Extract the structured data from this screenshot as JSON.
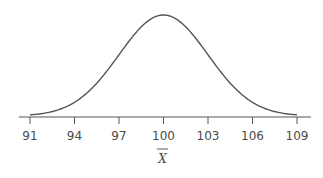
{
  "chart_data": {
    "type": "line",
    "title": "",
    "xlabel": "X̄",
    "ylabel": "",
    "distribution": {
      "family": "normal",
      "mean": 100,
      "sd": 3
    },
    "x_ticks": [
      91,
      94,
      97,
      100,
      103,
      106,
      109
    ],
    "xlim": [
      91,
      109
    ],
    "grid": false,
    "legend": null,
    "colors": {
      "curve": "#555555",
      "axis": "#555555",
      "text": "#4a4a4a"
    }
  },
  "axis": {
    "tick_labels": [
      "91",
      "94",
      "97",
      "100",
      "103",
      "106",
      "109"
    ],
    "title": "X"
  }
}
